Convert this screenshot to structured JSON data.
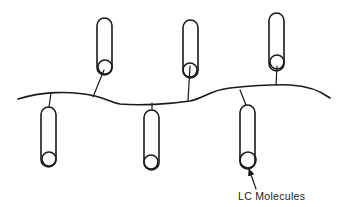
{
  "diagram": {
    "type": "side-chain liquid crystal polymer schematic",
    "backbone": {
      "label": "",
      "color": "#1a1a1a"
    },
    "molecules": [
      {
        "id": "m1",
        "side": "top",
        "pill": {
          "x": 97,
          "y": 18,
          "w": 15,
          "h": 57
        },
        "circle": {
          "cx": 105,
          "cy": 67,
          "r": 7
        },
        "stem": {
          "x1": 104,
          "y1": 70,
          "x2": 93,
          "y2": 97
        }
      },
      {
        "id": "m2",
        "side": "top",
        "pill": {
          "x": 183,
          "y": 20,
          "w": 15,
          "h": 58
        },
        "circle": {
          "cx": 190,
          "cy": 70,
          "r": 7
        },
        "stem": {
          "x1": 190,
          "y1": 66,
          "x2": 188,
          "y2": 101
        }
      },
      {
        "id": "m3",
        "side": "top",
        "pill": {
          "x": 269,
          "y": 13,
          "w": 15,
          "h": 58
        },
        "circle": {
          "cx": 277,
          "cy": 62,
          "r": 7
        },
        "stem": {
          "x1": 277,
          "y1": 66,
          "x2": 276,
          "y2": 85
        }
      },
      {
        "id": "m4",
        "side": "bottom",
        "pill": {
          "x": 41,
          "y": 107,
          "w": 15,
          "h": 60
        },
        "circle": {
          "cx": 49,
          "cy": 159,
          "r": 7
        },
        "stem": {
          "x1": 51,
          "y1": 93,
          "x2": 49,
          "y2": 107
        }
      },
      {
        "id": "m5",
        "side": "bottom",
        "pill": {
          "x": 144,
          "y": 110,
          "w": 15,
          "h": 60
        },
        "circle": {
          "cx": 151,
          "cy": 162,
          "r": 7
        },
        "stem": {
          "x1": 152,
          "y1": 103,
          "x2": 152,
          "y2": 110
        }
      },
      {
        "id": "m6",
        "side": "bottom",
        "pill": {
          "x": 240,
          "y": 105,
          "w": 15,
          "h": 64
        },
        "circle": {
          "cx": 248,
          "cy": 160,
          "r": 8
        },
        "stem": {
          "x1": 240,
          "y1": 90,
          "x2": 246,
          "y2": 105
        }
      }
    ],
    "annotation": {
      "text": "LC Molecules",
      "arrow_target": "m6"
    }
  }
}
